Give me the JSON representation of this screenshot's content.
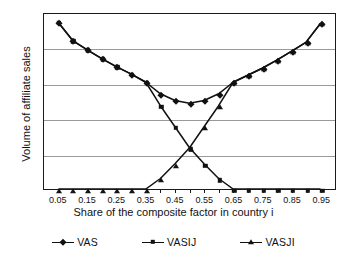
{
  "chart_data": {
    "type": "line",
    "title": "",
    "xlabel": "Share of the composite factor in country i",
    "ylabel": "Volume of affiliate sales",
    "xlim": [
      0.0,
      1.0
    ],
    "ylim": [
      0,
      5
    ],
    "yticks": [
      0,
      1,
      2,
      3,
      4,
      5
    ],
    "ytick_labels": [
      "0",
      "1",
      "2",
      "3",
      "4",
      "5"
    ],
    "grid": "horizontal",
    "legend_position": "bottom",
    "x": [
      0.05,
      0.1,
      0.15,
      0.2,
      0.25,
      0.3,
      0.35,
      0.4,
      0.45,
      0.5,
      0.55,
      0.6,
      0.65,
      0.7,
      0.75,
      0.8,
      0.85,
      0.9,
      0.95
    ],
    "xtick_labels": [
      "0.05",
      "0.15",
      "0.25",
      "0.35",
      "0.45",
      "0.55",
      "0.65",
      "0.75",
      "0.85",
      "0.95"
    ],
    "xtick_values": [
      0.05,
      0.15,
      0.25,
      0.35,
      0.45,
      0.55,
      0.65,
      0.75,
      0.85,
      0.95
    ],
    "series": [
      {
        "name": "VAS",
        "marker": "diamond",
        "values": [
          4.75,
          4.23,
          3.97,
          3.72,
          3.49,
          3.28,
          3.05,
          2.72,
          2.53,
          2.45,
          2.53,
          2.72,
          3.05,
          3.25,
          3.45,
          3.68,
          3.93,
          4.19,
          4.73
        ]
      },
      {
        "name": "VASIJ",
        "marker": "square",
        "values": [
          4.75,
          4.23,
          3.97,
          3.72,
          3.49,
          3.28,
          3.05,
          2.38,
          1.78,
          1.18,
          0.72,
          0.3,
          0.0,
          0.0,
          0.0,
          0.0,
          0.0,
          0.0,
          0.0
        ]
      },
      {
        "name": "VASJI",
        "marker": "triangle",
        "values": [
          0.0,
          0.0,
          0.0,
          0.0,
          0.0,
          0.0,
          0.0,
          0.3,
          0.72,
          1.18,
          1.78,
          2.38,
          3.05,
          3.25,
          3.45,
          3.68,
          3.93,
          4.19,
          4.73
        ]
      }
    ]
  },
  "colors": {
    "line": "#111111",
    "grid": "#9a9a9a",
    "frame": "#1a1a1a",
    "background": "#ffffff"
  }
}
